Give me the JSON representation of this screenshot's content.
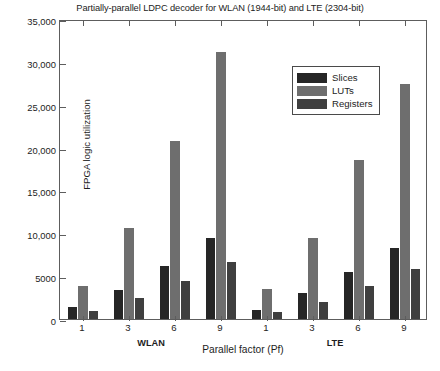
{
  "chart_data": {
    "type": "bar",
    "title": "Partially-parallel LDPC decoder for WLAN (1944-bit) and LTE (2304-bit)",
    "xlabel": "Parallel factor (Pf)",
    "ylabel": "FPGA logic utilization",
    "ylim": [
      0,
      35000
    ],
    "ytick_values": [
      0,
      5000,
      10000,
      15000,
      20000,
      25000,
      30000,
      35000
    ],
    "ytick_labels": [
      "0",
      "5000",
      "10,000",
      "15,000",
      "20,000",
      "25,000",
      "30,000",
      "35,000"
    ],
    "grid": false,
    "legend_position": "upper center",
    "categories": [
      "1",
      "3",
      "6",
      "9",
      "1",
      "3",
      "6",
      "9"
    ],
    "groups": [
      {
        "name": "WLAN",
        "categories": [
          "1",
          "3",
          "6",
          "9"
        ],
        "series": [
          {
            "name": "Slices",
            "values": [
              1400,
              3400,
              6200,
              9500
            ]
          },
          {
            "name": "LUTs",
            "values": [
              3900,
              10600,
              20800,
              31200
            ]
          },
          {
            "name": "Registers",
            "values": [
              900,
              2400,
              4400,
              6700
            ]
          }
        ]
      },
      {
        "name": "LTE",
        "categories": [
          "1",
          "3",
          "6",
          "9"
        ],
        "series": [
          {
            "name": "Slices",
            "values": [
              1100,
              3000,
              5500,
              8300
            ]
          },
          {
            "name": "LUTs",
            "values": [
              3500,
              9500,
              18500,
              27400
            ]
          },
          {
            "name": "Registers",
            "values": [
              800,
              2000,
              3900,
              5800
            ]
          }
        ]
      }
    ],
    "series": [
      {
        "name": "Slices",
        "color": "#262626",
        "values": [
          1400,
          3400,
          6200,
          9500,
          1100,
          3000,
          5500,
          8300
        ]
      },
      {
        "name": "LUTs",
        "color": "#6e6e6e",
        "values": [
          3900,
          10600,
          20800,
          31200,
          3500,
          9500,
          18500,
          27400
        ]
      },
      {
        "name": "Registers",
        "color": "#3f3f3f",
        "values": [
          900,
          2400,
          4400,
          6700,
          800,
          2000,
          3900,
          5800
        ]
      }
    ],
    "legend": [
      "Slices",
      "LUTs",
      "Registers"
    ]
  }
}
